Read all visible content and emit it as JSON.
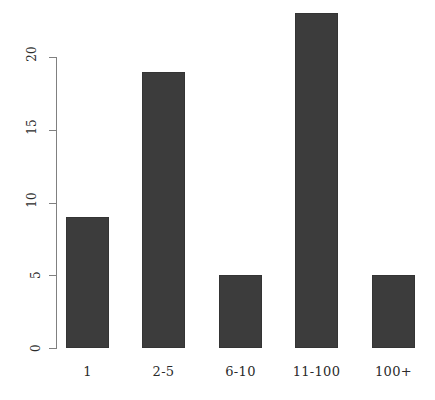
{
  "chart_data": {
    "type": "bar",
    "title": "",
    "subtitle": "",
    "xlabel": "",
    "ylabel": "",
    "categories": [
      "1",
      "2-5",
      "6-10",
      "11-100",
      "100+"
    ],
    "values": [
      9,
      19,
      5,
      23,
      5
    ],
    "yticks": [
      0,
      5,
      10,
      15,
      20
    ],
    "ytick_labels": [
      "0",
      "5",
      "10",
      "15",
      "20"
    ],
    "ylim": [
      0,
      23.5
    ],
    "grid": false,
    "legend": false,
    "bar_color": "#3c3c3c",
    "axis_color": "#808080",
    "text_color": "#2b2b2b",
    "background": "#ffffff",
    "ytick_label_rotation": -90
  }
}
